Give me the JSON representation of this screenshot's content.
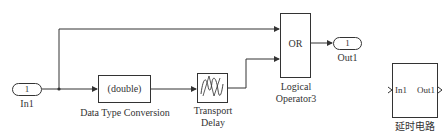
{
  "diagram": {
    "inport": {
      "number": "1",
      "label": "In1"
    },
    "data_type_conversion": {
      "text": "(double)",
      "label": "Data Type Conversion"
    },
    "transport_delay": {
      "label_line1": "Transport",
      "label_line2": "Delay"
    },
    "logical_operator": {
      "text": "OR",
      "label_line1": "Logical",
      "label_line2": "Operator3"
    },
    "outport": {
      "number": "1",
      "label": "Out1"
    },
    "subsystem": {
      "in_port": "In1",
      "out_port": "Out1",
      "label": "延时电路"
    }
  },
  "colors": {
    "line": "#333333",
    "background": "#ffffff"
  }
}
